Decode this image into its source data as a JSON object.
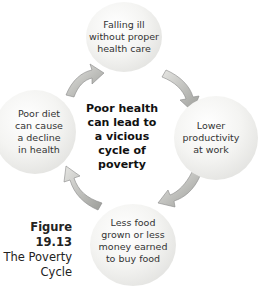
{
  "diagram": {
    "center_text": [
      "Poor health",
      "can lead to",
      "a vicious",
      "cycle of",
      "poverty"
    ],
    "nodes": [
      {
        "id": "top",
        "lines": [
          "Falling ill",
          "without proper",
          "health care"
        ]
      },
      {
        "id": "right",
        "lines": [
          "Lower",
          "productivity",
          "at work"
        ]
      },
      {
        "id": "bottom",
        "lines": [
          "Less food",
          "grown or less",
          "money earned",
          "to buy food"
        ]
      },
      {
        "id": "left",
        "lines": [
          "Poor diet",
          "can cause",
          "a decline",
          "in health"
        ]
      }
    ],
    "arrow_color": "#a9aaa6",
    "caption": {
      "number": "Figure 19.13",
      "title_lines": [
        "The Poverty",
        "Cycle"
      ]
    }
  }
}
